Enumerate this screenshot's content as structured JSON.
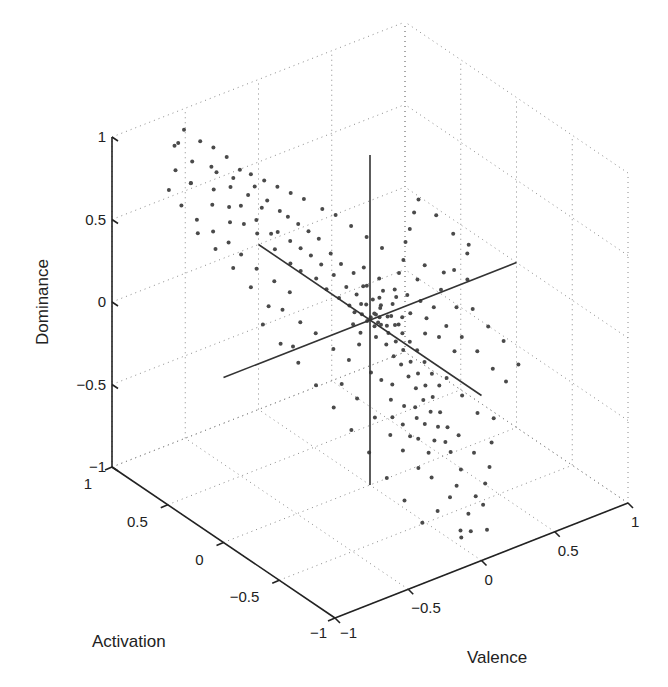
{
  "chart_data": {
    "type": "scatter",
    "dimensions": 3,
    "title": "",
    "xlabel": "Valence",
    "ylabel": "Activation",
    "zlabel": "Dominance",
    "xlim": [
      -1,
      1
    ],
    "ylim": [
      -1,
      1
    ],
    "zlim": [
      -1,
      1
    ],
    "grid": true,
    "legend": null,
    "x_ticks": [
      -1,
      -0.5,
      0,
      0.5,
      1
    ],
    "y_ticks": [
      -1,
      -0.5,
      0,
      0.5,
      1
    ],
    "z_ticks": [
      -1,
      -0.5,
      0,
      0.5,
      1
    ],
    "x_tick_labels": [
      "−1",
      "−0.5",
      "0",
      "0.5",
      "1"
    ],
    "y_tick_labels": [
      "−1",
      "−0.5",
      "0",
      "0.5",
      "1"
    ],
    "z_tick_labels": [
      "−1",
      "−0.5",
      "0",
      "0.5",
      "1"
    ],
    "reference_lines": [
      {
        "name": "valence-axis-through-origin",
        "from": [
          -1,
          0,
          0
        ],
        "to": [
          1,
          0,
          0
        ]
      },
      {
        "name": "activation-axis-through-origin",
        "from": [
          0,
          1,
          0
        ],
        "to": [
          0,
          -1,
          0
        ]
      },
      {
        "name": "dominance-axis-through-origin",
        "from": [
          0,
          0,
          1
        ],
        "to": [
          0,
          0,
          -1
        ]
      }
    ],
    "marker_color": "#4a4a4a",
    "series": [
      {
        "name": "samples",
        "note": "points are (valence, activation, dominance); representative sample of the dense cloud",
        "points": [
          [
            -0.78,
            0.72,
            0.85
          ],
          [
            -0.7,
            0.8,
            0.95
          ],
          [
            -0.62,
            0.78,
            0.82
          ],
          [
            -0.72,
            0.66,
            0.78
          ],
          [
            -0.55,
            0.7,
            0.8
          ],
          [
            -0.66,
            0.74,
            0.72
          ],
          [
            -0.58,
            0.64,
            0.7
          ],
          [
            -0.5,
            0.72,
            0.74
          ],
          [
            -0.45,
            0.66,
            0.66
          ],
          [
            -0.62,
            0.6,
            0.64
          ],
          [
            -0.52,
            0.58,
            0.6
          ],
          [
            -0.4,
            0.7,
            0.68
          ],
          [
            -0.44,
            0.58,
            0.58
          ],
          [
            -0.36,
            0.62,
            0.6
          ],
          [
            -0.56,
            0.52,
            0.55
          ],
          [
            -0.48,
            0.5,
            0.52
          ],
          [
            -0.3,
            0.64,
            0.62
          ],
          [
            -0.38,
            0.52,
            0.5
          ],
          [
            -0.32,
            0.55,
            0.54
          ],
          [
            -0.26,
            0.58,
            0.55
          ],
          [
            -0.42,
            0.46,
            0.46
          ],
          [
            -0.34,
            0.44,
            0.44
          ],
          [
            -0.22,
            0.52,
            0.5
          ],
          [
            -0.28,
            0.46,
            0.42
          ],
          [
            -0.18,
            0.5,
            0.46
          ],
          [
            -0.36,
            0.38,
            0.38
          ],
          [
            -0.24,
            0.4,
            0.38
          ],
          [
            -0.14,
            0.46,
            0.42
          ],
          [
            -0.2,
            0.36,
            0.34
          ],
          [
            -0.3,
            0.32,
            0.3
          ],
          [
            -0.1,
            0.42,
            0.38
          ],
          [
            -0.16,
            0.32,
            0.3
          ],
          [
            -0.26,
            0.28,
            0.26
          ],
          [
            -0.06,
            0.38,
            0.34
          ],
          [
            -0.12,
            0.28,
            0.25
          ],
          [
            -0.2,
            0.22,
            0.22
          ],
          [
            -0.04,
            0.3,
            0.28
          ],
          [
            -0.08,
            0.22,
            0.2
          ],
          [
            -0.16,
            0.18,
            0.16
          ],
          [
            0.0,
            0.26,
            0.22
          ],
          [
            -0.04,
            0.16,
            0.14
          ],
          [
            -0.12,
            0.12,
            0.12
          ],
          [
            0.04,
            0.2,
            0.18
          ],
          [
            0.0,
            0.12,
            0.1
          ],
          [
            -0.08,
            0.08,
            0.08
          ],
          [
            0.06,
            0.14,
            0.12
          ],
          [
            0.02,
            0.06,
            0.06
          ],
          [
            -0.04,
            0.02,
            0.04
          ],
          [
            0.08,
            0.08,
            0.06
          ],
          [
            0.04,
            0.0,
            0.02
          ],
          [
            0.1,
            0.04,
            0.02
          ],
          [
            0.0,
            -0.04,
            -0.02
          ],
          [
            0.06,
            -0.02,
            -0.04
          ],
          [
            0.12,
            0.0,
            -0.02
          ],
          [
            -0.02,
            -0.08,
            -0.06
          ],
          [
            0.08,
            -0.06,
            -0.08
          ],
          [
            0.14,
            -0.04,
            -0.06
          ],
          [
            0.02,
            -0.12,
            -0.1
          ],
          [
            0.1,
            -0.1,
            -0.12
          ],
          [
            0.16,
            -0.08,
            -0.1
          ],
          [
            0.04,
            -0.16,
            -0.16
          ],
          [
            0.12,
            -0.14,
            -0.16
          ],
          [
            0.18,
            -0.12,
            -0.14
          ],
          [
            0.06,
            -0.2,
            -0.2
          ],
          [
            0.14,
            -0.18,
            -0.22
          ],
          [
            0.2,
            -0.16,
            -0.18
          ],
          [
            0.08,
            -0.24,
            -0.26
          ],
          [
            0.16,
            -0.22,
            -0.28
          ],
          [
            0.22,
            -0.2,
            -0.24
          ],
          [
            0.1,
            -0.28,
            -0.32
          ],
          [
            0.18,
            -0.26,
            -0.34
          ],
          [
            0.24,
            -0.24,
            -0.3
          ],
          [
            0.12,
            -0.32,
            -0.38
          ],
          [
            0.2,
            -0.3,
            -0.4
          ],
          [
            0.26,
            -0.28,
            -0.36
          ],
          [
            0.14,
            -0.36,
            -0.44
          ],
          [
            0.22,
            -0.34,
            -0.48
          ],
          [
            0.08,
            -0.3,
            -0.42
          ],
          [
            0.16,
            -0.4,
            -0.52
          ],
          [
            0.24,
            -0.38,
            -0.56
          ],
          [
            0.1,
            -0.36,
            -0.5
          ],
          [
            0.18,
            -0.44,
            -0.6
          ],
          [
            0.06,
            -0.34,
            -0.46
          ],
          [
            0.2,
            -0.46,
            -0.66
          ],
          [
            0.12,
            -0.42,
            -0.58
          ],
          [
            0.0,
            -0.2,
            -0.3
          ],
          [
            -0.04,
            -0.24,
            -0.36
          ],
          [
            0.02,
            -0.28,
            -0.4
          ],
          [
            -0.06,
            -0.18,
            -0.26
          ],
          [
            -0.1,
            -0.14,
            -0.22
          ],
          [
            -0.02,
            -0.32,
            -0.48
          ],
          [
            0.04,
            -0.38,
            -0.56
          ],
          [
            -0.06,
            -0.28,
            -0.44
          ],
          [
            0.0,
            -0.36,
            -0.54
          ],
          [
            0.08,
            -0.42,
            -0.64
          ],
          [
            0.3,
            -0.1,
            -0.14
          ],
          [
            0.34,
            -0.06,
            -0.08
          ],
          [
            0.38,
            -0.12,
            -0.18
          ],
          [
            0.42,
            -0.02,
            -0.06
          ],
          [
            0.46,
            -0.08,
            -0.16
          ],
          [
            0.5,
            0.02,
            0.0
          ],
          [
            0.56,
            -0.04,
            -0.1
          ],
          [
            0.62,
            0.06,
            0.06
          ],
          [
            0.68,
            0.02,
            0.0
          ],
          [
            0.74,
            0.1,
            0.1
          ],
          [
            0.4,
            0.1,
            0.06
          ],
          [
            0.48,
            0.14,
            0.1
          ],
          [
            0.3,
            0.06,
            0.02
          ],
          [
            0.36,
            0.02,
            -0.02
          ],
          [
            0.26,
            -0.02,
            -0.04
          ],
          [
            0.44,
            -0.18,
            -0.26
          ],
          [
            0.52,
            -0.14,
            -0.22
          ],
          [
            0.58,
            -0.2,
            -0.3
          ],
          [
            0.64,
            -0.26,
            -0.4
          ],
          [
            0.7,
            -0.3,
            -0.48
          ],
          [
            0.34,
            -0.24,
            -0.36
          ],
          [
            0.4,
            -0.3,
            -0.46
          ],
          [
            0.46,
            -0.36,
            -0.56
          ],
          [
            0.3,
            -0.4,
            -0.62
          ],
          [
            0.36,
            -0.46,
            -0.72
          ],
          [
            0.24,
            -0.5,
            -0.76
          ],
          [
            0.18,
            -0.54,
            -0.82
          ],
          [
            0.28,
            -0.58,
            -0.9
          ],
          [
            0.12,
            -0.56,
            -0.86
          ],
          [
            0.2,
            -0.62,
            -0.96
          ],
          [
            0.04,
            -0.5,
            -0.74
          ],
          [
            -0.02,
            -0.46,
            -0.68
          ],
          [
            0.02,
            -0.58,
            -0.9
          ],
          [
            -0.08,
            -0.4,
            -0.58
          ],
          [
            -0.12,
            -0.34,
            -0.5
          ],
          [
            -0.18,
            -0.28,
            -0.4
          ],
          [
            -0.24,
            -0.2,
            -0.3
          ],
          [
            -0.3,
            -0.14,
            -0.22
          ],
          [
            -0.22,
            -0.1,
            -0.12
          ],
          [
            -0.28,
            -0.04,
            -0.06
          ],
          [
            -0.34,
            0.04,
            0.02
          ],
          [
            -0.4,
            0.1,
            0.08
          ],
          [
            -0.46,
            0.18,
            0.14
          ],
          [
            -0.38,
            0.22,
            0.2
          ],
          [
            -0.44,
            0.28,
            0.26
          ],
          [
            -0.5,
            0.36,
            0.32
          ],
          [
            -0.56,
            0.42,
            0.4
          ],
          [
            -0.6,
            0.48,
            0.46
          ],
          [
            -0.66,
            0.54,
            0.52
          ],
          [
            -0.74,
            0.58,
            0.6
          ],
          [
            -0.8,
            0.64,
            0.68
          ],
          [
            -0.84,
            0.7,
            0.76
          ],
          [
            -0.68,
            0.86,
            0.9
          ],
          [
            -0.6,
            0.88,
            0.96
          ],
          [
            -0.52,
            0.84,
            0.88
          ],
          [
            -0.46,
            0.8,
            0.84
          ],
          [
            -0.4,
            0.76,
            0.78
          ],
          [
            -0.34,
            0.72,
            0.7
          ],
          [
            -0.28,
            0.7,
            0.66
          ],
          [
            -0.22,
            0.66,
            0.62
          ],
          [
            -0.16,
            0.62,
            0.58
          ],
          [
            -0.1,
            0.58,
            0.54
          ],
          [
            -0.04,
            0.54,
            0.5
          ],
          [
            0.04,
            0.48,
            0.44
          ],
          [
            0.1,
            0.44,
            0.4
          ],
          [
            0.16,
            0.38,
            0.34
          ],
          [
            0.22,
            0.32,
            0.28
          ],
          [
            0.28,
            0.26,
            0.22
          ],
          [
            0.14,
            0.24,
            0.16
          ],
          [
            0.2,
            0.18,
            0.1
          ],
          [
            0.26,
            0.12,
            0.04
          ],
          [
            0.32,
            0.16,
            0.1
          ],
          [
            0.38,
            0.2,
            0.14
          ],
          [
            0.44,
            0.26,
            0.2
          ],
          [
            0.5,
            0.3,
            0.24
          ],
          [
            0.56,
            0.34,
            0.3
          ],
          [
            0.62,
            0.38,
            0.34
          ],
          [
            0.68,
            0.3,
            0.26
          ],
          [
            0.72,
            0.2,
            0.18
          ],
          [
            0.78,
            0.14,
            0.12
          ],
          [
            0.58,
            0.1,
            0.04
          ],
          [
            0.64,
            -0.08,
            -0.12
          ],
          [
            0.7,
            -0.14,
            -0.22
          ],
          [
            0.76,
            -0.2,
            -0.3
          ],
          [
            0.8,
            -0.28,
            -0.42
          ],
          [
            0.54,
            -0.4,
            -0.6
          ],
          [
            0.48,
            -0.46,
            -0.7
          ],
          [
            0.42,
            -0.52,
            -0.8
          ],
          [
            0.36,
            -0.56,
            -0.86
          ],
          [
            0.3,
            -0.62,
            -0.94
          ],
          [
            0.1,
            -0.68,
            -1.0
          ],
          [
            0.14,
            -0.72,
            -1.0
          ],
          [
            0.06,
            -0.74,
            -1.0
          ],
          [
            0.22,
            -0.76,
            -1.0
          ],
          [
            -0.1,
            -0.6,
            -0.92
          ],
          [
            -0.16,
            -0.52,
            -0.8
          ],
          [
            -0.22,
            -0.44,
            -0.68
          ],
          [
            -0.28,
            -0.36,
            -0.54
          ],
          [
            -0.34,
            -0.28,
            -0.42
          ],
          [
            -0.4,
            -0.2,
            -0.3
          ],
          [
            -0.46,
            -0.12,
            -0.18
          ],
          [
            -0.52,
            -0.04,
            -0.06
          ],
          [
            -0.58,
            0.04,
            0.04
          ],
          [
            -0.64,
            0.12,
            0.14
          ],
          [
            -0.48,
            0.06,
            -0.02
          ],
          [
            -0.54,
            0.2,
            0.18
          ],
          [
            -0.6,
            0.28,
            0.28
          ],
          [
            -0.66,
            0.36,
            0.38
          ],
          [
            -0.72,
            0.44,
            0.48
          ],
          [
            -0.78,
            0.52,
            0.56
          ],
          [
            0.02,
            0.02,
            0.0
          ],
          [
            0.06,
            0.04,
            0.0
          ],
          [
            -0.02,
            0.0,
            0.0
          ],
          [
            0.04,
            -0.02,
            -0.02
          ],
          [
            0.08,
            0.02,
            -0.02
          ],
          [
            -0.06,
            0.06,
            0.04
          ],
          [
            0.1,
            -0.02,
            -0.06
          ],
          [
            0.12,
            0.06,
            0.02
          ],
          [
            -0.08,
            -0.02,
            -0.04
          ],
          [
            0.0,
            0.08,
            0.06
          ],
          [
            0.16,
            0.02,
            -0.04
          ],
          [
            0.18,
            -0.02,
            -0.08
          ],
          [
            0.14,
            0.1,
            0.04
          ],
          [
            -0.1,
            0.02,
            0.0
          ],
          [
            -0.12,
            -0.06,
            -0.08
          ],
          [
            0.2,
            0.06,
            0.0
          ],
          [
            0.22,
            0.0,
            -0.06
          ],
          [
            0.24,
            0.08,
            0.02
          ],
          [
            0.18,
            0.12,
            0.06
          ],
          [
            0.1,
            0.16,
            0.1
          ]
        ]
      }
    ]
  },
  "projection": {
    "origin_px": [
      335,
      618
    ],
    "x_unit_px": [
      146.5,
      -57.5
    ],
    "y_unit_px": [
      -111.5,
      -75.5
    ],
    "z_unit_px": [
      0,
      -165
    ]
  }
}
